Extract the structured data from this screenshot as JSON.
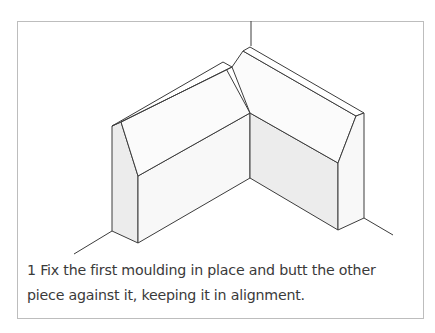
{
  "figure": {
    "step_number": "1",
    "caption": "1 Fix the first moulding in place and butt the other piece against it, keeping it in alignment.",
    "caption_line1": "1 Fix the first moulding in place and butt the other",
    "caption_line2": "piece against it, keeping it in alignment.",
    "illustration": "Isometric line drawing of two skirting board mouldings meeting at an internal wall corner",
    "colors": {
      "line": "#3c3c3c",
      "shaded_face": "#ececec",
      "light_face": "#f8f8f8",
      "frame": "#bdbdbd"
    }
  }
}
